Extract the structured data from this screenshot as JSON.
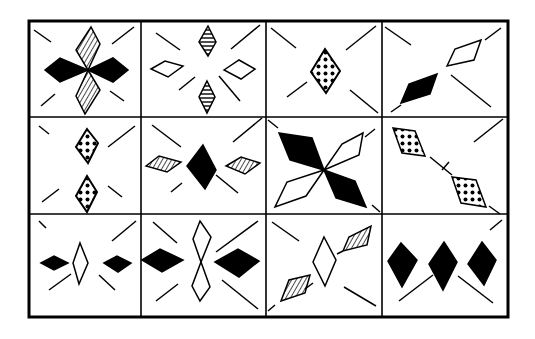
{
  "puzzle": {
    "title": "",
    "rows": 3,
    "cols": 4,
    "colors": {
      "ink": "#000000",
      "paper": "#ffffff"
    },
    "cells": [
      {
        "row": 0,
        "col": 0,
        "description": "two black horizontal diamonds left/right and two hatched vertical diamonds top/bottom meeting at center; four diagonal ticks"
      },
      {
        "row": 0,
        "col": 1,
        "description": "two horizontally-striped vertical diamonds top/bottom and two white horizontal diamonds left/right; four diagonal ticks"
      },
      {
        "row": 0,
        "col": 2,
        "description": "single dotted vertical diamond at center; four diagonal ticks"
      },
      {
        "row": 0,
        "col": 3,
        "description": "white diamond upper-right and black diamond lower-left on diagonal; diagonal ticks"
      },
      {
        "row": 1,
        "col": 0,
        "description": "two small dotted vertical diamonds stacked at center; four diagonal ticks"
      },
      {
        "row": 1,
        "col": 1,
        "description": "black vertical diamond at center with two hatched horizontal diamonds left/right; four diagonal ticks"
      },
      {
        "row": 1,
        "col": 2,
        "description": "two large black diamonds along main diagonal and two white diamonds along anti-diagonal forming an X"
      },
      {
        "row": 1,
        "col": 3,
        "description": "two dotted diamonds along the main diagonal with a crossing tick; diagonal tick upper-right"
      },
      {
        "row": 2,
        "col": 0,
        "description": "white vertical diamond at center flanked by two small black horizontal diamonds; four diagonal ticks"
      },
      {
        "row": 2,
        "col": 1,
        "description": "two white vertical diamonds stacked at center flanked by two black horizontal diamonds; four diagonal ticks"
      },
      {
        "row": 2,
        "col": 2,
        "description": "white vertical diamond at center with two hatched diamonds along anti-diagonal; diagonal ticks"
      },
      {
        "row": 2,
        "col": 3,
        "description": "three black vertical diamonds in a row; diagonal ticks"
      }
    ]
  }
}
